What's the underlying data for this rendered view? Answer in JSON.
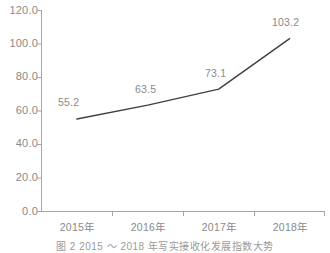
{
  "chart_data": {
    "type": "line",
    "title": "",
    "subtitle": "",
    "xlabel": "",
    "ylabel": "",
    "categories": [
      "2015年",
      "2016年",
      "2017年",
      "2018年"
    ],
    "x": [
      "2015年",
      "2016年",
      "2017年",
      "2018年"
    ],
    "values": [
      55.2,
      63.5,
      73.1,
      103.2
    ],
    "series": [
      {
        "name": "",
        "values": [
          55.2,
          63.5,
          73.1,
          103.2
        ],
        "color": "#3f3f3f",
        "marker": "none",
        "line_width": 1.4
      }
    ],
    "data_labels": [
      "55.2",
      "63.5",
      "73.1",
      "103.2"
    ],
    "ylim": [
      0.0,
      120.0
    ],
    "yticks": [
      0.0,
      20.0,
      40.0,
      60.0,
      80.0,
      100.0,
      120.0
    ],
    "ytick_labels": [
      "0.0",
      "20.0",
      "40.0",
      "60.0",
      "80.0",
      "100.0",
      "120.0"
    ],
    "grid": false,
    "legend": false,
    "legend_position": "none",
    "axis_color": "#a6a6a6",
    "text_color": "#8a8a8a"
  },
  "caption": {
    "text": "图 2   2015 ～ 2018 年写实接收化发展指数大势"
  }
}
